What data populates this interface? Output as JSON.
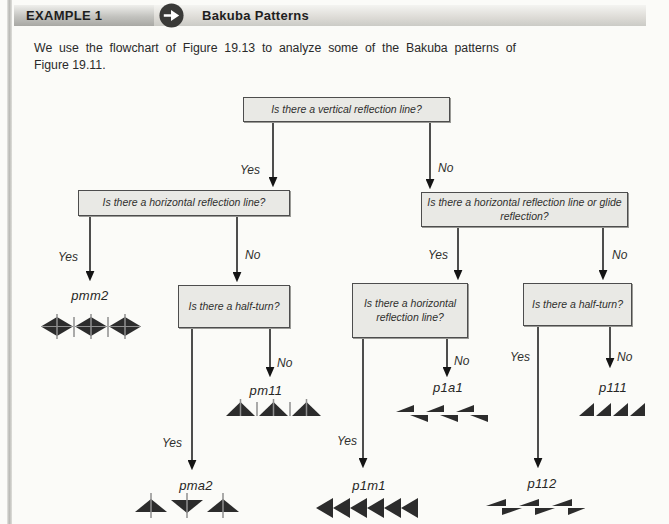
{
  "header": {
    "example_label": "EXAMPLE 1",
    "title": "Bakuba Patterns",
    "icon": "right-arrow-icon"
  },
  "intro": {
    "line1": "We use the flowchart of Figure 19.13 to analyze some of the Bakuba patterns of",
    "line2": "Figure 19.11."
  },
  "flowchart": {
    "labels": {
      "yes": "Yes",
      "no": "No"
    },
    "nodes": {
      "root": "Is there a vertical reflection line?",
      "left": "Is there a horizontal reflection line?",
      "right": "Is there a horizontal reflection line or glide reflection?",
      "left_half_turn": "Is there a half-turn?",
      "mid_horizontal": "Is there a horizontal reflection line?",
      "right_half_turn": "Is there a half-turn?"
    },
    "results": {
      "pmm2": "pmm2",
      "pm11": "pm11",
      "pma2": "pma2",
      "p1a1": "p1a1",
      "p1m1": "p1m1",
      "p111": "p111",
      "p112": "p112"
    },
    "pattern_icons": {
      "pmm2": "diamond-bar-strip-pattern",
      "pm11": "triangle-bar-strip-pattern",
      "pma2": "alternating-triangle-bar-strip-pattern",
      "p1a1": "glide-reflection-triangle-strip-pattern",
      "p1m1": "left-pointing-triangle-strip-pattern",
      "p111": "repeated-wedge-strip-pattern",
      "p112": "half-turn-wedge-strip-pattern"
    },
    "colors": {
      "box_fill": "#e9e9e5",
      "box_border": "#4d4d4d",
      "arrow": "#141414",
      "pattern_fill": "#2c2c2c",
      "pattern_bar": "#8f8f8f"
    }
  }
}
